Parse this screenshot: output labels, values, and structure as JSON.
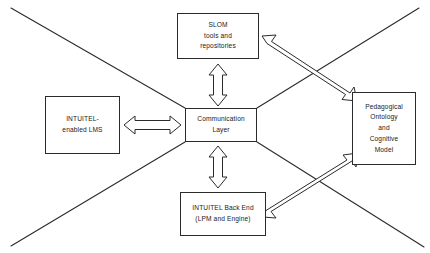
{
  "diagram": {
    "background_color": "#ffffff",
    "stroke_color": "#2b2b2b",
    "text_color": "#1a1a1a",
    "nodes": [
      {
        "id": "slom",
        "name": "slom-tools-and-repositories",
        "lines": [
          "SLOM",
          "tools and",
          "repositories"
        ]
      },
      {
        "id": "lms",
        "name": "intuitel-enabled-lms",
        "lines": [
          "INTUITEL-",
          "enabled LMS"
        ]
      },
      {
        "id": "communication",
        "name": "communication-layer",
        "lines": [
          "Communication",
          "Layer"
        ]
      },
      {
        "id": "pedagogy",
        "name": "pedagogical-ontology-and-cognitive-model",
        "lines": [
          "Pedagogical",
          "Ontology",
          "and",
          "Cognitive",
          "Model"
        ]
      },
      {
        "id": "backend",
        "name": "intuitel-back-end",
        "lines": [
          "INTUITEL Back End",
          "(LPM and Engine)"
        ]
      }
    ],
    "connectors": [
      {
        "name": "slom-to-communication-arrow",
        "style": "double-headed-block-arrow",
        "orientation": "vertical",
        "from": "slom",
        "to": "communication"
      },
      {
        "name": "lms-to-communication-arrow",
        "style": "double-headed-block-arrow",
        "orientation": "horizontal",
        "from": "lms",
        "to": "communication"
      },
      {
        "name": "communication-to-backend-arrow",
        "style": "double-headed-block-arrow",
        "orientation": "vertical",
        "from": "communication",
        "to": "backend"
      },
      {
        "name": "pedagogy-to-slom-arrow",
        "style": "single-headed-block-arrow",
        "orientation": "diagonal-up-left",
        "from": "pedagogy",
        "to": "slom"
      },
      {
        "name": "pedagogy-to-backend-arrow",
        "style": "single-headed-block-arrow",
        "orientation": "diagonal-down-left",
        "from": "pedagogy",
        "to": "backend"
      }
    ],
    "guide_lines": [
      {
        "name": "diagonal-line-top-left-to-center"
      },
      {
        "name": "diagonal-line-top-right-to-center"
      },
      {
        "name": "diagonal-line-bottom-left-to-center"
      },
      {
        "name": "diagonal-line-bottom-right-to-center"
      }
    ]
  }
}
